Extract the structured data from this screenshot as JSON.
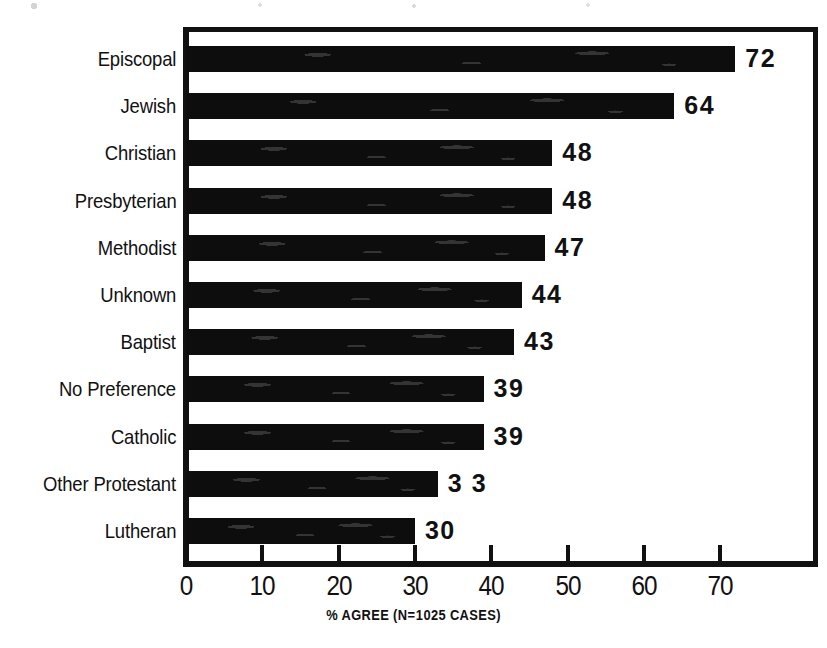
{
  "chart_data": {
    "type": "bar",
    "orientation": "horizontal",
    "title": "",
    "subtitle": "",
    "xlabel": "% AGREE (N = 1025 CASES)",
    "ylabel": "",
    "categories": [
      "Episcopal",
      "Jewish",
      "Christian",
      "Presbyterian",
      "Methodist",
      "Unknown",
      "Baptist",
      "No Preference",
      "Catholic",
      "Other Protestant",
      "Lutheran"
    ],
    "values": [
      72,
      64,
      48,
      48,
      47,
      44,
      43,
      39,
      39,
      33,
      30
    ],
    "value_labels": [
      "72",
      "64",
      "48",
      "48",
      "47",
      "44",
      "43",
      "39",
      "39",
      "3 3",
      "30"
    ],
    "xlim": [
      0,
      83.5
    ],
    "xticks": [
      0,
      10,
      20,
      30,
      40,
      50,
      60,
      70
    ],
    "xtick_labels": [
      "0",
      "10",
      "20",
      "30",
      "40",
      "50",
      "60",
      "70"
    ],
    "grid": false,
    "legend": false,
    "legend_position": "none",
    "bar_color": "#0d0d0d",
    "background_color": "#ffffff",
    "axis_color": "#111111",
    "sample_size": 1025,
    "caption_parts": {
      "percent_agree": "% AGREE (N",
      "equals": "=",
      "n_cases": "1025 CASES)"
    }
  }
}
